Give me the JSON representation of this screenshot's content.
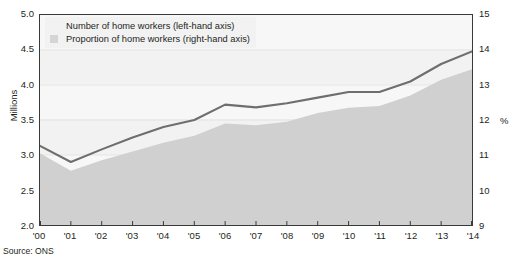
{
  "source_note": "Source: ONS",
  "legend": {
    "position": "top-left-inside",
    "items": [
      {
        "label": "Number of home workers (left-hand axis)",
        "marker": "line",
        "color": "#6e6e6e"
      },
      {
        "label": "Proportion of home workers (right-hand axis)",
        "marker": "area-swatch",
        "color": "#d5d5d5"
      }
    ]
  },
  "axes": {
    "left_title": "Millions",
    "right_title": "%",
    "left_ticks": [
      "2.0",
      "2.5",
      "3.0",
      "3.5",
      "4.0",
      "4.5",
      "5.0"
    ],
    "right_ticks": [
      "9",
      "10",
      "11",
      "12",
      "13",
      "14",
      "15"
    ],
    "x_ticks": [
      "'00",
      "'01",
      "'02",
      "'03",
      "'04",
      "'05",
      "'06",
      "'07",
      "'08",
      "'09",
      "'10",
      "'11",
      "'12",
      "'13",
      "'14"
    ]
  },
  "colors": {
    "line": "#6e6e6e",
    "area": "#d0d0d0",
    "plot_background": "#f2f2f2",
    "band_light": "#f7f7f7",
    "frame": "#3a3a3a",
    "text": "#231f20"
  },
  "chart_data": {
    "type": "line",
    "title": "",
    "subtitle": "",
    "xlabel": "",
    "ylabel": "Millions",
    "y2label": "%",
    "grid": true,
    "legend_position": "top-left",
    "x": [
      "'00",
      "'01",
      "'02",
      "'03",
      "'04",
      "'05",
      "'06",
      "'07",
      "'08",
      "'09",
      "'10",
      "'11",
      "'12",
      "'13",
      "'14"
    ],
    "ylim": [
      2.0,
      5.0
    ],
    "y2lim": [
      9,
      15
    ],
    "series": [
      {
        "name": "Number of home workers (left-hand axis)",
        "axis": "left",
        "units": "Millions",
        "type": "line",
        "color": "#6e6e6e",
        "values": [
          3.13,
          2.9,
          3.08,
          3.25,
          3.4,
          3.5,
          3.72,
          3.68,
          3.74,
          3.82,
          3.9,
          3.9,
          4.05,
          4.3,
          4.48
        ]
      },
      {
        "name": "Proportion of home workers (right-hand axis)",
        "axis": "right",
        "units": "%",
        "type": "area",
        "color": "#d0d0d0",
        "values": [
          11.05,
          10.55,
          10.85,
          11.1,
          11.35,
          11.55,
          11.9,
          11.85,
          11.95,
          12.2,
          12.35,
          12.4,
          12.7,
          13.15,
          13.45
        ]
      }
    ]
  }
}
